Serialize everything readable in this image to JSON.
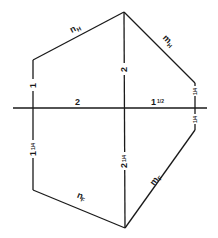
{
  "diagram": {
    "type": "hexagonal frame dimension sketch",
    "labels": {
      "top_left_edge": "n",
      "top_left_edge_sub": "H",
      "top_right_edge": "m",
      "top_right_edge_sub": "H",
      "bottom_left_edge": "n",
      "bottom_left_edge_sub": "F",
      "bottom_right_edge": "m",
      "bottom_right_edge_sub": "F",
      "left_upper_dim": "1",
      "left_lower_dim_whole": "1",
      "left_lower_dim_frac": "1/4",
      "center_upper_dim": "2",
      "center_lower_dim_whole": "2",
      "center_lower_dim_frac": "1/4",
      "horizontal_left_dim": "2",
      "horizontal_right_dim_whole": "1",
      "horizontal_right_dim_frac": "1/2",
      "right_upper_dim_frac": "1/4",
      "right_lower_dim_frac": "1/4"
    },
    "colors": {
      "line": "#1a1a1a",
      "background": "#ffffff"
    }
  }
}
